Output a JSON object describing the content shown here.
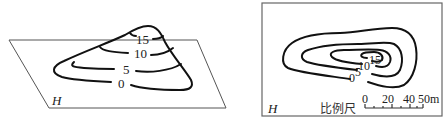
{
  "figure_left": {
    "plane_label": "H",
    "contour_labels": [
      "15",
      "10",
      "5",
      "0"
    ],
    "description": "Perspective view of a hill on plane H with contour lines"
  },
  "figure_right": {
    "plane_label": "H",
    "contour_labels": [
      "0",
      "5",
      "10",
      "15"
    ],
    "scale_label": "比例尺",
    "scale_ticks": [
      "0",
      "20",
      "40",
      "50m"
    ],
    "description": "Contour map (plan view) with scale bar"
  }
}
